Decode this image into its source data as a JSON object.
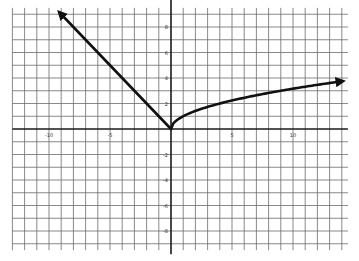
{
  "chart_data": {
    "type": "line",
    "title": "",
    "xlabel": "",
    "ylabel": "",
    "xlim": [
      -13,
      14.5
    ],
    "ylim": [
      -9.5,
      9.5
    ],
    "grid": true,
    "grid_step": 1,
    "x_ticks": [
      {
        "value": -10,
        "label": "-10"
      },
      {
        "value": -5,
        "label": "-5"
      },
      {
        "value": 5,
        "label": "5"
      },
      {
        "value": 10,
        "label": "10"
      }
    ],
    "y_ticks": [
      {
        "value": 8,
        "label": "8"
      },
      {
        "value": 6,
        "label": "6"
      },
      {
        "value": 4,
        "label": "4"
      },
      {
        "value": 2,
        "label": "2"
      },
      {
        "value": -2,
        "label": "-2"
      },
      {
        "value": -4,
        "label": "-4"
      },
      {
        "value": -6,
        "label": "-6"
      },
      {
        "value": -8,
        "label": "-8"
      }
    ],
    "series": [
      {
        "name": "left-branch",
        "description": "y = -x for x <= 0",
        "points": [
          [
            -9.1,
            9.1
          ],
          [
            0,
            0
          ]
        ],
        "arrow_at": "start"
      },
      {
        "name": "right-branch",
        "description": "y = sqrt(x) for x >= 0",
        "function": "sqrt",
        "x_range": [
          0,
          14
        ],
        "arrow_at": "end"
      }
    ],
    "colors": {
      "curve": "#111111",
      "grid": "#6b6b6b",
      "axis": "#1a1a1a",
      "background": "#ffffff"
    }
  }
}
